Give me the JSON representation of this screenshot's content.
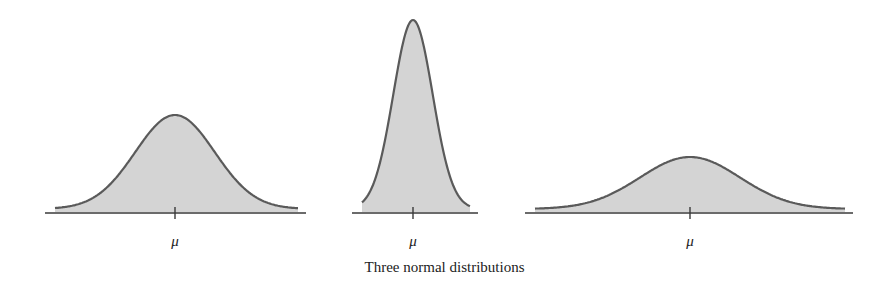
{
  "chart_data": {
    "type": "area",
    "title": "Three normal distributions",
    "xlabel": "",
    "ylabel": "",
    "grid": false,
    "legend": null,
    "panels": [
      {
        "name": "moderate-spread",
        "mean_label": "μ",
        "relative_sd": 1.0,
        "relative_peak_height": 0.51,
        "baseline_px": [
          45,
          306
        ],
        "center_px": 175,
        "peak_y_px": 115
      },
      {
        "name": "narrow-spread",
        "mean_label": "μ",
        "relative_sd": 0.55,
        "relative_peak_height": 1.0,
        "baseline_px": [
          352,
          478
        ],
        "center_px": 413,
        "peak_y_px": 20
      },
      {
        "name": "wide-spread",
        "mean_label": "μ",
        "relative_sd": 2.0,
        "relative_peak_height": 0.28,
        "baseline_px": [
          525,
          853
        ],
        "center_px": 690,
        "peak_y_px": 157
      }
    ]
  },
  "labels": {
    "mu": "μ",
    "caption": "Three normal distributions"
  },
  "colors": {
    "fill": "#d4d4d4",
    "curve": "#5a5a5a",
    "axis": "#3a3a3a"
  }
}
